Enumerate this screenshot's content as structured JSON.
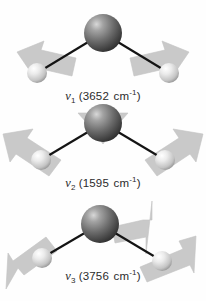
{
  "figure": {
    "background_color": "#fefefe",
    "atom_colors": {
      "oxygen": "#6e6e6e",
      "oxygen_dark": "#3a3a3a",
      "hydrogen": "#e2e2e2",
      "hydrogen_dark": "#9a9a9a",
      "bond": "#1a1a1a",
      "arrow": "#c9c9c9",
      "arrow_edge": "#bdbdbd",
      "text": "#2b2b2b"
    }
  },
  "modes": [
    {
      "id": "mode-1",
      "symbol": "v",
      "subscript": "1",
      "frequency": "3652",
      "unit": "cm",
      "unit_exponent": "-1",
      "label_full": "v1 (3652 cm-1)",
      "mode_name": "symmetric-stretch",
      "atoms": [
        {
          "element": "O",
          "name": "oxygen-atom",
          "x": 103,
          "y": 33,
          "r": 19
        },
        {
          "element": "H",
          "name": "hydrogen-atom-left",
          "x": 37,
          "y": 73,
          "r": 10
        },
        {
          "element": "H",
          "name": "hydrogen-atom-right",
          "x": 169,
          "y": 73,
          "r": 10
        }
      ],
      "arrows": [
        {
          "name": "arrow-left-hydrogen",
          "direction": "up-right"
        },
        {
          "name": "arrow-right-hydrogen",
          "direction": "up-left"
        }
      ]
    },
    {
      "id": "mode-2",
      "symbol": "v",
      "subscript": "2",
      "frequency": "1595",
      "unit": "cm",
      "unit_exponent": "-1",
      "label_full": "v2 (1595 cm-1)",
      "mode_name": "bend",
      "atoms": [
        {
          "element": "O",
          "name": "oxygen-atom",
          "x": 103,
          "y": 23,
          "r": 19
        },
        {
          "element": "H",
          "name": "hydrogen-atom-left",
          "x": 41,
          "y": 60,
          "r": 10
        },
        {
          "element": "H",
          "name": "hydrogen-atom-right",
          "x": 165,
          "y": 60,
          "r": 10
        }
      ],
      "arrows": [
        {
          "name": "arrow-left-hydrogen",
          "direction": "up-left"
        },
        {
          "name": "arrow-right-hydrogen",
          "direction": "up-right"
        },
        {
          "name": "arrow-oxygen",
          "direction": "down"
        }
      ]
    },
    {
      "id": "mode-3",
      "symbol": "v",
      "subscript": "3",
      "frequency": "3756",
      "unit": "cm",
      "unit_exponent": "-1",
      "label_full": "v3 (3756 cm-1)",
      "mode_name": "asymmetric-stretch",
      "atoms": [
        {
          "element": "O",
          "name": "oxygen-atom",
          "x": 100,
          "y": 28,
          "r": 19
        },
        {
          "element": "H",
          "name": "hydrogen-atom-left",
          "x": 42,
          "y": 62,
          "r": 10
        },
        {
          "element": "H",
          "name": "hydrogen-atom-right",
          "x": 162,
          "y": 65,
          "r": 10
        }
      ],
      "arrows": [
        {
          "name": "arrow-oxygen",
          "direction": "up-right"
        },
        {
          "name": "arrow-left-hydrogen",
          "direction": "down-left"
        },
        {
          "name": "arrow-right-hydrogen",
          "direction": "down-right"
        }
      ]
    }
  ]
}
